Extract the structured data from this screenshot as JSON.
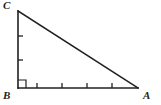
{
  "figure": {
    "type": "geometry-diagram",
    "background_color": "#ffffff",
    "stroke_color": "#231f20",
    "labels": {
      "vertex_a": "A",
      "vertex_b": "B",
      "vertex_c": "C"
    },
    "vertices": {
      "A": {
        "x": 138,
        "y": 88
      },
      "B": {
        "x": 18,
        "y": 88
      },
      "C": {
        "x": 18,
        "y": 11
      }
    },
    "right_angle": {
      "at_vertex": "B",
      "marker": "square",
      "size": 8
    },
    "sides": [
      {
        "name": "BC",
        "from": "B",
        "to": "C",
        "tick_count": 2,
        "orientation": "vertical"
      },
      {
        "name": "BA",
        "from": "B",
        "to": "A",
        "tick_count": 4,
        "orientation": "horizontal"
      },
      {
        "name": "CA",
        "from": "C",
        "to": "A",
        "tick_count": 0,
        "orientation": "hypotenuse"
      }
    ],
    "tick_marks": {
      "vertical_y": [
        36,
        60
      ],
      "horizontal_x": [
        37,
        62,
        87,
        112
      ],
      "length": 5
    }
  }
}
